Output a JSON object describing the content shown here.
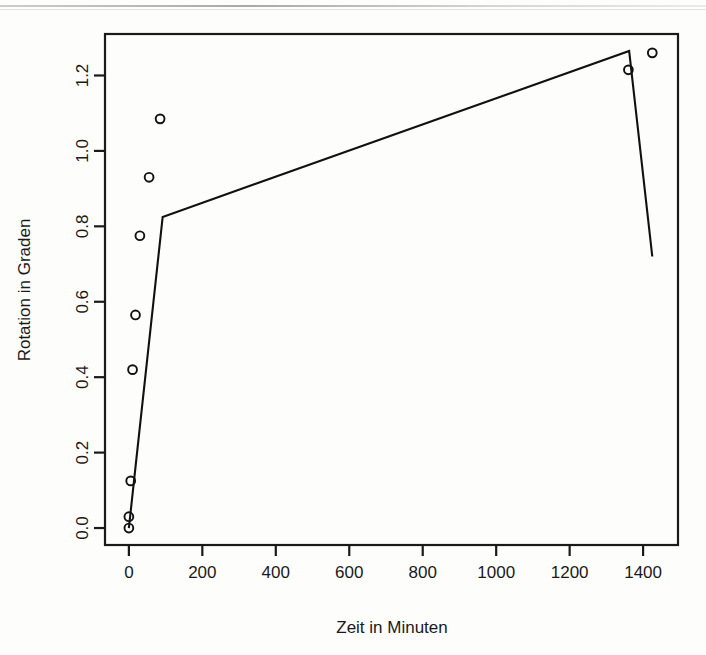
{
  "chart_data": {
    "type": "scatter",
    "title": "",
    "xlabel": "Zeit in Minuten",
    "ylabel": "Rotation in Graden",
    "xlim": [
      -65,
      1495
    ],
    "ylim": [
      -0.045,
      1.31
    ],
    "xticks": [
      0,
      200,
      400,
      600,
      800,
      1000,
      1200,
      1400
    ],
    "xtick_labels": [
      "0",
      "200",
      "400",
      "600",
      "800",
      "1000",
      "1200",
      "1400"
    ],
    "yticks": [
      0.0,
      0.2,
      0.4,
      0.6,
      0.8,
      1.0,
      1.2
    ],
    "ytick_labels": [
      "0.0",
      "0.2",
      "0.4",
      "0.6",
      "0.8",
      "1.0",
      "1.2"
    ],
    "grid": false,
    "legend": null,
    "marker": "open-circle",
    "marker_color": "#111111",
    "line_color": "#111111",
    "points": [
      {
        "x": 0,
        "y": 0.0
      },
      {
        "x": 0,
        "y": 0.03
      },
      {
        "x": 5,
        "y": 0.125
      },
      {
        "x": 10,
        "y": 0.42
      },
      {
        "x": 18,
        "y": 0.565
      },
      {
        "x": 30,
        "y": 0.775
      },
      {
        "x": 55,
        "y": 0.93
      },
      {
        "x": 85,
        "y": 1.085
      },
      {
        "x": 1360,
        "y": 1.215
      },
      {
        "x": 1425,
        "y": 1.26
      }
    ],
    "series": [
      {
        "name": "fit",
        "type": "line",
        "x": [
          0,
          92,
          1362,
          1425
        ],
        "values": [
          0.0,
          0.825,
          1.265,
          0.72
        ]
      }
    ]
  },
  "figure": {
    "frame_color": "#1a1a1a",
    "background": "#fdfdfc"
  }
}
